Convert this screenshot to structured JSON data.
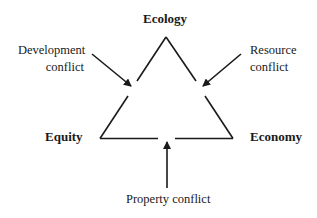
{
  "diagram": {
    "nodes": {
      "top": "Ecology",
      "left": "Equity",
      "right": "Economy"
    },
    "conflicts": {
      "development": [
        "Development",
        "conflict"
      ],
      "resource": [
        "Resource",
        "conflict"
      ],
      "property": "Property conflict"
    },
    "colors": {
      "stroke": "#1a1a1a",
      "background": "#ffffff"
    }
  }
}
